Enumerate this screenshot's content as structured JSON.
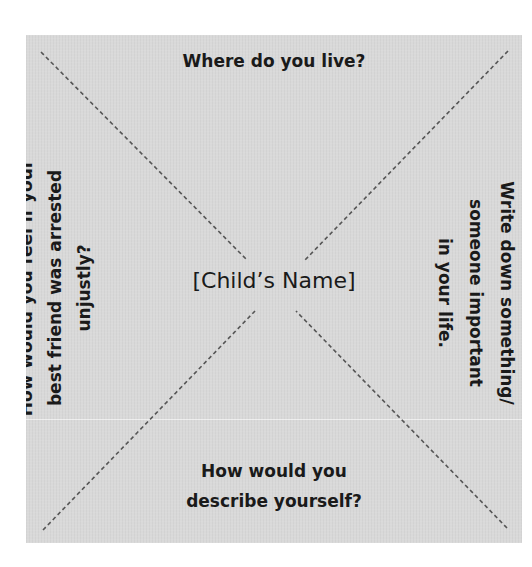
{
  "worksheet": {
    "square_color": "#d9d9d9",
    "line_color": "#555555",
    "text_color": "#1a1a1a",
    "center_label": "[Child’s Name]",
    "prompts": {
      "top": {
        "lines": [
          "Where do you live?"
        ]
      },
      "bottom": {
        "lines": [
          "How would you",
          "describe yourself?"
        ]
      },
      "left": {
        "orientation": "rotated -90deg",
        "lines": [
          "How would you feel if your",
          "best friend was arrested",
          "unjustly?"
        ]
      },
      "right": {
        "orientation": "rotated 90deg",
        "lines": [
          "Write down something/",
          "someone important",
          "in your life."
        ]
      }
    }
  }
}
